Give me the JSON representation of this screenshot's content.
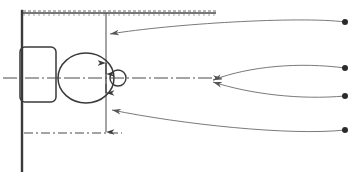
{
  "drawing": {
    "title": "Toilet fixture plan view with dimension callouts",
    "type": "engineering-line-drawing",
    "canvas": {
      "width": 354,
      "height": 172,
      "background": "#ffffff"
    },
    "colors": {
      "line": "#3a3a3a",
      "line_light": "#6e6e6e",
      "leader": "#7a7a7a",
      "centerline": "#4a4a4a",
      "dot": "#2b2b2b",
      "background": "#ffffff"
    },
    "wall": {
      "label": "wall",
      "x": 22,
      "y_top": 12,
      "y_bottom": 170,
      "stroke_width": 2.2
    },
    "tank": {
      "label": "cistern-tank",
      "x": 20,
      "y": 47,
      "width": 36,
      "height": 55,
      "corner_radius": 5
    },
    "bowl": {
      "label": "toilet-bowl-oval",
      "cx": 86,
      "cy": 78,
      "rx": 28,
      "ry": 25
    },
    "outlet": {
      "label": "outlet-small-circle",
      "cx": 118,
      "cy": 78,
      "r": 8
    },
    "dimension_top": {
      "label": "top-dimension-line",
      "x_start": 24,
      "x_end": 215,
      "y": 13,
      "style": "hatched-dimension"
    },
    "dimension_vertical_upper": {
      "label": "vertical-dimension-upper",
      "x": 106,
      "y_top": 14,
      "y_bottom": 78,
      "arrow": "down"
    },
    "dimension_vertical_lower": {
      "label": "vertical-dimension-lower",
      "x": 106,
      "y_top": 78,
      "y_bottom": 132,
      "arrow": "down"
    },
    "dimension_bowl_inner": {
      "label": "bowl-inner-dimension",
      "x": 106,
      "y_top": 63,
      "y_bottom": 93,
      "arrow": "double"
    },
    "centerline_horizontal": {
      "label": "horizontal-centerline",
      "x_start": 4,
      "x_end": 222,
      "y": 78,
      "style": "dash-dot",
      "arrow": "right"
    },
    "centerline_bottom": {
      "label": "bottom-dash-dot-line",
      "x_start": 24,
      "x_end": 120,
      "y": 133,
      "style": "dash-dot"
    },
    "leaders": [
      {
        "label": "leader-callout-1",
        "from_x": 345,
        "from_y": 22,
        "to_x": 110,
        "to_y": 34,
        "c1x": 300,
        "c1y": 16,
        "c2x": 170,
        "c2y": 24,
        "arrow": "left",
        "dot": {
          "cx": 345,
          "cy": 22,
          "r": 3.0
        }
      },
      {
        "label": "leader-callout-2",
        "from_x": 345,
        "from_y": 68,
        "to_x": 213,
        "to_y": 80,
        "c1x": 300,
        "c1y": 62,
        "c2x": 250,
        "c2y": 66,
        "arrow": "left",
        "dot": {
          "cx": 345,
          "cy": 68,
          "r": 3.0
        }
      },
      {
        "label": "leader-callout-3",
        "from_x": 345,
        "from_y": 96,
        "to_x": 213,
        "to_y": 82,
        "c1x": 300,
        "c1y": 100,
        "c2x": 250,
        "c2y": 94,
        "arrow": "left",
        "dot": {
          "cx": 345,
          "cy": 96,
          "r": 3.0
        }
      },
      {
        "label": "leader-callout-4",
        "from_x": 345,
        "from_y": 130,
        "to_x": 112,
        "to_y": 110,
        "c1x": 290,
        "c1y": 136,
        "c2x": 180,
        "c2y": 124,
        "arrow": "left",
        "dot": {
          "cx": 345,
          "cy": 130,
          "r": 3.0
        }
      }
    ]
  }
}
